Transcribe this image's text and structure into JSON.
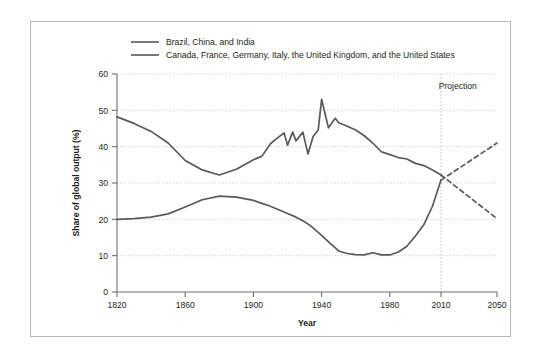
{
  "chart_data": {
    "type": "line",
    "title": "",
    "xlabel": "Year",
    "ylabel": "Share of global output (%)",
    "xlim": [
      1820,
      2050
    ],
    "ylim": [
      0,
      60
    ],
    "grid": true,
    "legend_position": "top-left",
    "xticks": [
      1820,
      1860,
      1900,
      1940,
      1980,
      2010,
      2050
    ],
    "xtick_labels": [
      "1820",
      "1860",
      "1900",
      "1940",
      "1980",
      "2010",
      "2050"
    ],
    "yticks": [
      0,
      10,
      20,
      30,
      40,
      50,
      60
    ],
    "ytick_labels": [
      "0",
      "10",
      "20",
      "30",
      "40",
      "50",
      "60"
    ],
    "annotations": [
      {
        "text": "Projection",
        "x": 2022,
        "y": 56
      }
    ],
    "projection_divider_year": 2010,
    "series": [
      {
        "name": "Brazil, China, and India",
        "color": "#58595b",
        "style": "solid",
        "x": [
          1820,
          1830,
          1840,
          1850,
          1860,
          1870,
          1880,
          1890,
          1900,
          1905,
          1910,
          1913,
          1920,
          1925,
          1929,
          1933,
          1938,
          1940,
          1945,
          1950,
          1955,
          1960,
          1965,
          1970,
          1975,
          1980,
          1985,
          1990,
          1995,
          2000,
          2005,
          2010
        ],
        "values": [
          20.0,
          20.2,
          20.6,
          21.5,
          23.4,
          25.4,
          26.4,
          26.1,
          25.2,
          24.4,
          23.6,
          23.0,
          21.6,
          20.6,
          19.6,
          18.4,
          16.4,
          15.6,
          13.4,
          11.3,
          10.6,
          10.3,
          10.2,
          10.8,
          10.2,
          10.2,
          11.0,
          12.6,
          15.4,
          18.6,
          23.6,
          30.8
        ]
      },
      {
        "name": "Canada, France, Germany, Italy, the United Kingdom, and the United States",
        "color": "#58595b",
        "style": "solid",
        "x": [
          1820,
          1830,
          1840,
          1850,
          1860,
          1870,
          1880,
          1890,
          1900,
          1905,
          1910,
          1913,
          1918,
          1920,
          1923,
          1925,
          1929,
          1932,
          1935,
          1938,
          1940,
          1944,
          1948,
          1950,
          1955,
          1960,
          1965,
          1970,
          1975,
          1980,
          1985,
          1990,
          1995,
          2000,
          2005,
          2010
        ],
        "values": [
          48.2,
          46.4,
          44.2,
          41.0,
          36.2,
          33.6,
          32.2,
          33.8,
          36.4,
          37.4,
          40.8,
          42.0,
          43.8,
          40.4,
          44.0,
          41.6,
          44.0,
          38.0,
          42.8,
          44.6,
          53.0,
          45.2,
          47.8,
          46.6,
          45.6,
          44.6,
          43.0,
          41.0,
          38.6,
          37.8,
          37.0,
          36.6,
          35.4,
          34.8,
          33.6,
          32.2
        ]
      },
      {
        "name": "Brazil, China, and India (projection)",
        "color": "#58595b",
        "style": "dashed",
        "x": [
          2010,
          2050
        ],
        "values": [
          30.8,
          41.0
        ]
      },
      {
        "name": "Canada, France, Germany, Italy, the United Kingdom, and the United States (projection)",
        "color": "#58595b",
        "style": "dashed",
        "x": [
          2010,
          2050
        ],
        "values": [
          32.2,
          20.2
        ]
      }
    ]
  },
  "legend": {
    "items": [
      {
        "label": "Brazil, China, and India"
      },
      {
        "label": "Canada, France, Germany, Italy, the United Kingdom, and the United States"
      }
    ]
  }
}
